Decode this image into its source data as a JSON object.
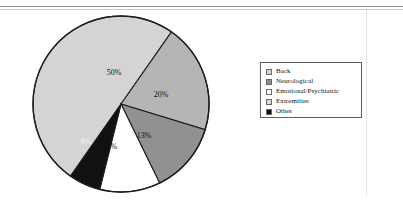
{
  "chart_data": {
    "type": "pie",
    "title": "",
    "subtitle": "",
    "categories": [
      "Back",
      "Neurological",
      "Emotional/Psychiatric",
      "Extremities",
      "Other"
    ],
    "values": [
      50,
      20,
      13,
      11,
      6
    ],
    "value_labels": [
      "50%",
      "20%",
      "13%",
      "11%",
      "6%"
    ],
    "unit": "%",
    "legend_position": "right",
    "grid": false,
    "slices": [
      {
        "label": "Back",
        "value": 50,
        "value_label": "50%",
        "color": "#d4d4d4",
        "start_angle": 215,
        "end_angle": 35,
        "label_x": 83,
        "label_y": 59,
        "label_on_dark": false
      },
      {
        "label": "Neurological",
        "value": 20,
        "value_label": "20%",
        "color": "#b5b5b5",
        "start_angle": 35,
        "end_angle": 107,
        "label_x": 130,
        "label_y": 81,
        "label_on_dark": false
      },
      {
        "label": "Emotional/Psychiatric",
        "value": 13,
        "value_label": "13%",
        "color": "#919191",
        "start_angle": 107,
        "end_angle": 154,
        "label_x": 113,
        "label_y": 122,
        "label_on_dark": false
      },
      {
        "label": "Extremities",
        "value": 11,
        "value_label": "11%",
        "color": "#ffffff",
        "start_angle": 154,
        "end_angle": 194,
        "label_x": 79,
        "label_y": 133,
        "label_on_dark": false
      },
      {
        "label": "Other",
        "value": 6,
        "value_label": "6%",
        "color": "#111111",
        "start_angle": 194,
        "end_angle": 215,
        "label_x": 55,
        "label_y": 128,
        "label_on_dark": true
      }
    ],
    "geometry": {
      "center_x": 90,
      "center_y": 90,
      "radius": 88
    }
  },
  "legend": {
    "items": [
      {
        "label": "Back",
        "color": "#d4d4d4"
      },
      {
        "label": "Neurological",
        "color": "#8f8f8f"
      },
      {
        "label": "Emotional/Psychiatric",
        "color": "#ffffff"
      },
      {
        "label": "Extremities",
        "color": "#dcdcdc"
      },
      {
        "label": "Other",
        "color": "#111111"
      }
    ]
  }
}
